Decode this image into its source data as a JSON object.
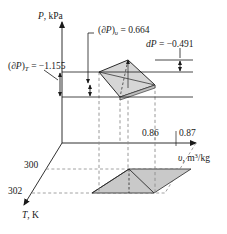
{
  "figure": {
    "kind": "thermodynamic-surface-diagram",
    "axes": {
      "vertical": {
        "name": "P-axis",
        "label": "P, kPa",
        "symbol": "P",
        "unit": "kPa"
      },
      "horizontal": {
        "name": "v-axis",
        "label": "v, m3/kg",
        "symbol": "υ",
        "unit": "m³/kg"
      },
      "depth": {
        "name": "T-axis",
        "label": "T, K",
        "symbol": "T",
        "unit": "K"
      }
    },
    "ticks": {
      "v": [
        "0.86",
        "0.87"
      ],
      "T": [
        "300",
        "302"
      ]
    },
    "annotations": [
      {
        "id": "dPv",
        "text": "(∂P)ᵥ = 0.664",
        "prefix": "(∂P)",
        "subscript": "υ",
        "value": "0.664",
        "equals": "="
      },
      {
        "id": "dP",
        "text": "dP = −0.491",
        "prefix": "dP",
        "subscript": "",
        "value": "−0.491",
        "equals": "="
      },
      {
        "id": "dPT",
        "text": "(∂P)ₜ = −1.155",
        "prefix": "(∂P)",
        "subscript": "T",
        "value": "−1.155",
        "equals": "="
      }
    ],
    "colors": {
      "line": "#1a1a1a",
      "dashed": "#8c8c8c",
      "fill_top": "#d6d6d6",
      "fill_bottom": "#c9c9c9",
      "background": "#ffffff"
    }
  }
}
